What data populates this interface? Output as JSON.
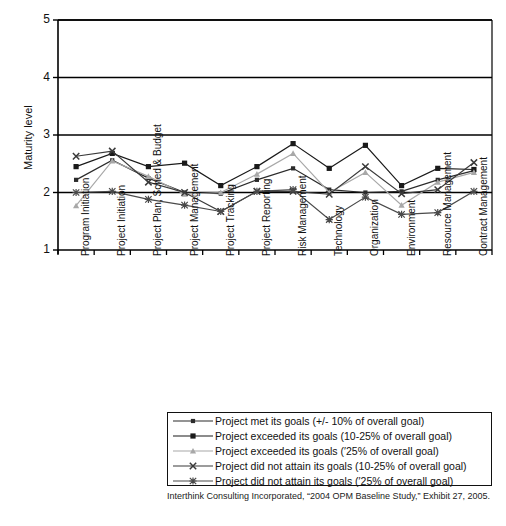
{
  "chart_data": {
    "type": "line",
    "title": "",
    "xlabel": "",
    "ylabel": "Maturity level",
    "ylim": [
      1,
      5
    ],
    "yticks": [
      1,
      2,
      3,
      4,
      5
    ],
    "grid": "horizontal gridlines at 2, 3, 4, 5",
    "legend_position": "below plot, boxed",
    "categories": [
      "Program Initiation",
      "Project Initiation",
      "Project Plan, Sched & Budget",
      "Project Management",
      "Project Tracking",
      "Project Reporting",
      "Risk Management",
      "Technology",
      "Organization",
      "Environment",
      "Resource Management",
      "Contract Management"
    ],
    "series": [
      {
        "name": "Project met its goals (+/- 10% of overall goal)",
        "marker": "dot",
        "color": "#2b2b2b",
        "values": [
          2.22,
          2.56,
          2.25,
          2.0,
          1.98,
          2.22,
          2.42,
          2.05,
          2.0,
          2.02,
          2.22,
          2.38
        ]
      },
      {
        "name": "Project exceeded its goals (10-25% of overall goal)",
        "marker": "square",
        "color": "#1a1a1a",
        "values": [
          2.45,
          2.68,
          2.45,
          2.51,
          2.12,
          2.45,
          2.85,
          2.42,
          2.82,
          2.12,
          2.42,
          2.4
        ]
      },
      {
        "name": "Project exceeded its goals (′25% of overall goal)",
        "marker": "triangle",
        "color": "#a8a8a8",
        "values": [
          1.77,
          2.55,
          2.28,
          1.97,
          2.0,
          2.32,
          2.68,
          2.0,
          2.35,
          1.78,
          2.18,
          2.35
        ]
      },
      {
        "name": "Project did not attain its goals (10-25% of overall goal)",
        "marker": "x",
        "color": "#3a3a3a",
        "values": [
          2.63,
          2.72,
          2.18,
          2.0,
          1.67,
          2.02,
          2.02,
          1.97,
          2.45,
          1.98,
          2.05,
          2.52
        ]
      },
      {
        "name": "Project did not attain its goals (′25% of overall goal)",
        "marker": "star",
        "color": "#4a4a4a",
        "values": [
          2.0,
          2.02,
          1.88,
          1.78,
          1.67,
          2.02,
          2.05,
          1.53,
          1.92,
          1.62,
          1.65,
          2.02
        ]
      }
    ]
  },
  "footer": {
    "source": "Interthink Consulting Incorporated, “2004 OPM Baseline Study,” Exhibit 27, 2005."
  }
}
